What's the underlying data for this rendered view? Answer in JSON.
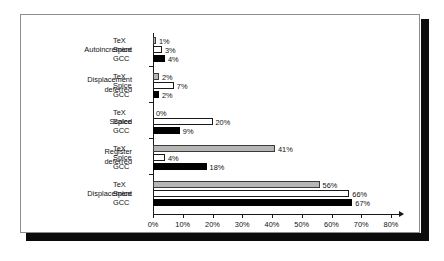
{
  "chart_data": {
    "type": "bar",
    "orientation": "horizontal",
    "title": "",
    "xlabel": "",
    "ylabel": "",
    "xlim": [
      0,
      80
    ],
    "xticks": [
      "0%",
      "10%",
      "20%",
      "30%",
      "40%",
      "50%",
      "60%",
      "70%",
      "80%"
    ],
    "xtick_values": [
      0,
      10,
      20,
      30,
      40,
      50,
      60,
      70,
      80
    ],
    "grid": false,
    "legend": "none",
    "categories": [
      "Autoincrement",
      "Displacement\ndeferred",
      "Scaled",
      "Register\ndeferred",
      "Displacement"
    ],
    "series": [
      {
        "name": "TeX",
        "style": "gray",
        "values": [
          1,
          2,
          0,
          41,
          56
        ],
        "labels": [
          "1%",
          "2%",
          "0%",
          "41%",
          "56%"
        ]
      },
      {
        "name": "Spice",
        "style": "white",
        "values": [
          3,
          7,
          20,
          4,
          66
        ],
        "labels": [
          "3%",
          "7%",
          "20%",
          "4%",
          "66%"
        ]
      },
      {
        "name": "GCC",
        "style": "black",
        "values": [
          4,
          2,
          9,
          18,
          67
        ],
        "labels": [
          "4%",
          "2%",
          "9%",
          "18%",
          "67%"
        ]
      }
    ],
    "colors": {
      "tex_fill": "#b6b6b6",
      "spice_fill": "#ffffff",
      "gcc_fill": "#000000",
      "outline": "#1a1a1a",
      "background": "#ffffff",
      "frame_border": "#8d8d8d",
      "shadow": "#0b0b0b"
    }
  }
}
